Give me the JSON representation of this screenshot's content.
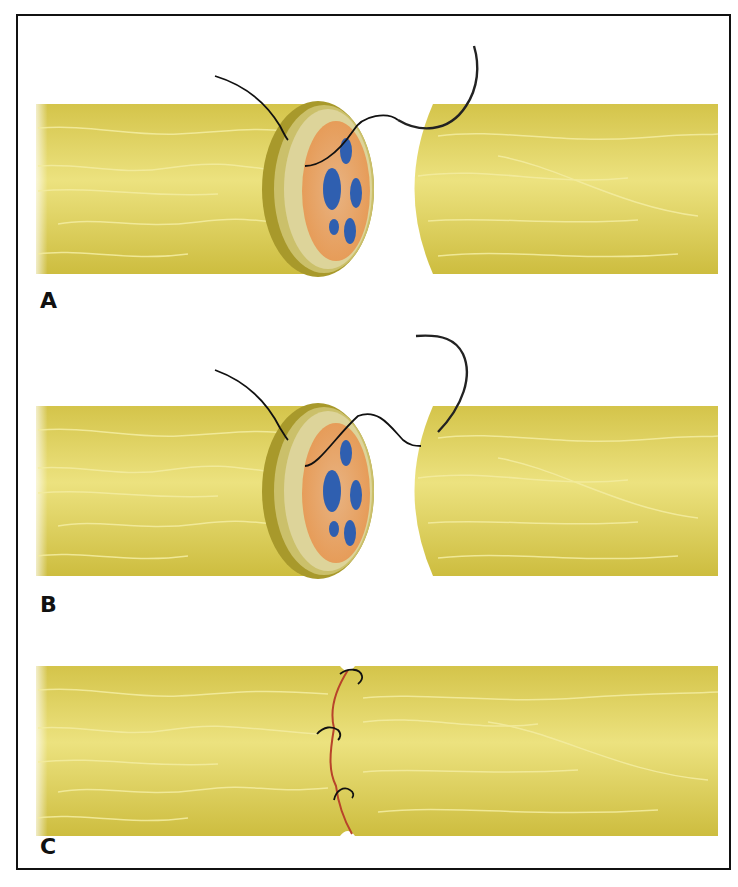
{
  "figure": {
    "panels": [
      {
        "id": "A",
        "label": "A",
        "step": "Suture needle passed through epineurium of proximal stump"
      },
      {
        "id": "B",
        "label": "B",
        "step": "Suture passed through epineurium of distal stump"
      },
      {
        "id": "C",
        "label": "C",
        "step": "Completed coaptation with interrupted epineurial sutures"
      }
    ],
    "colors": {
      "nerve": "#e2d568",
      "nerve_dark": "#c9b93a",
      "nerve_light": "#efe58f",
      "epineurium_rim": "#a89a2c",
      "perineurium": "#e8a86a",
      "fascicle": "#2f5fb0",
      "suture": "#111111",
      "suture_line": "#b8432a",
      "border": "#111111"
    }
  }
}
